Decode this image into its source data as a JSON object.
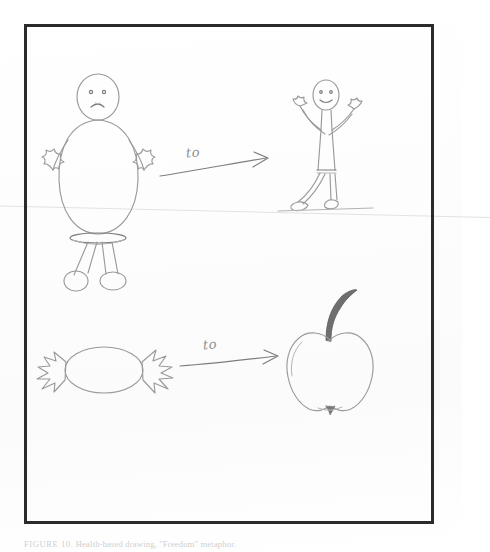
{
  "document": {
    "type": "scanned-pencil-drawing",
    "paper_color": "#fefefe",
    "ink_color": "#9a9a9a",
    "frame_color": "#2b2b2b"
  },
  "frame": {
    "label": "hand-drawn rectangular border"
  },
  "drawing": {
    "title_alt": "Two hand-drawn transformation metaphors",
    "rows": [
      {
        "name": "person-transformation-row",
        "source": {
          "name": "overweight-sad-person",
          "description": "Large round-bodied stick figure with a sad face, raised open hands, two legs and round shoes",
          "mood": "sad"
        },
        "arrow_label": "to",
        "target": {
          "name": "thin-happy-person",
          "description": "Slim stick figure with a smiling face and both arms raised in celebration",
          "mood": "happy"
        }
      },
      {
        "name": "food-transformation-row",
        "source": {
          "name": "wrapped-candy",
          "description": "A wrapped sweet / candy with jagged twisted wrapper ends on both sides"
        },
        "arrow_label": "to",
        "target": {
          "name": "apple",
          "description": "An apple outline with a dark shaded curved stem at the top"
        }
      }
    ]
  },
  "labels": {
    "arrow_top": "to",
    "arrow_bottom": "to"
  },
  "caption": {
    "prefix": "FIGURE 10.",
    "text": "Health-based drawing, \"Freedom\" metaphor.",
    "full": "FIGURE 10. Health-based drawing, \"Freedom\" metaphor."
  }
}
